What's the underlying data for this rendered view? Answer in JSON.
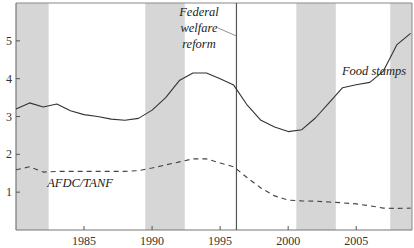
{
  "chart_data": {
    "type": "line",
    "title": "",
    "xlabel": "",
    "ylabel": "",
    "xlim": [
      1980,
      2009.1
    ],
    "ylim": [
      0,
      6
    ],
    "x_ticks": [
      1985,
      1990,
      1995,
      2000,
      2005
    ],
    "x_tick_labels": [
      "1985",
      "1990",
      "1995",
      "2000",
      "2005"
    ],
    "y_ticks": [
      1,
      2,
      3,
      4,
      5
    ],
    "y_tick_labels": [
      "1",
      "2",
      "3",
      "4",
      "5"
    ],
    "grid": false,
    "legend": "none (inline labels)",
    "shaded_periods": [
      {
        "start": 1980,
        "end": 1982.4
      },
      {
        "start": 1989.5,
        "end": 1992.4
      },
      {
        "start": 2000.6,
        "end": 2003.5
      },
      {
        "start": 2007.5,
        "end": 2009.1
      }
    ],
    "shade_color": "#d6d6d6",
    "vertical_marker": {
      "x": 1996.2,
      "label_lines": [
        "Federal",
        "welfare",
        "reform"
      ]
    },
    "x": [
      1980,
      1981,
      1982,
      1983,
      1984,
      1985,
      1986,
      1987,
      1988,
      1989,
      1990,
      1991,
      1992,
      1993,
      1994,
      1995,
      1996,
      1997,
      1998,
      1999,
      2000,
      2001,
      2002,
      2003,
      2004,
      2005,
      2006,
      2007,
      2008,
      2009
    ],
    "series": [
      {
        "name": "Food stamps",
        "style": "solid",
        "color": "#333333",
        "values": [
          3.2,
          3.36,
          3.25,
          3.33,
          3.15,
          3.05,
          3.0,
          2.93,
          2.9,
          2.95,
          3.17,
          3.5,
          3.95,
          4.15,
          4.15,
          4.0,
          3.83,
          3.3,
          2.9,
          2.72,
          2.6,
          2.65,
          2.96,
          3.36,
          3.76,
          3.84,
          3.9,
          4.2,
          4.9,
          5.2
        ]
      },
      {
        "name": "AFDC/TANF",
        "style": "dashed",
        "color": "#444444",
        "values": [
          1.59,
          1.67,
          1.53,
          1.55,
          1.55,
          1.55,
          1.55,
          1.55,
          1.55,
          1.57,
          1.64,
          1.72,
          1.8,
          1.88,
          1.88,
          1.77,
          1.67,
          1.38,
          1.11,
          0.9,
          0.79,
          0.77,
          0.76,
          0.74,
          0.72,
          0.69,
          0.64,
          0.58,
          0.57,
          0.58
        ]
      }
    ],
    "annotations": [
      {
        "text": "Food stamps",
        "x": 2003.5,
        "y": 4.4
      },
      {
        "text": "AFDC/TANF",
        "x": 1983.5,
        "y": 1.25
      },
      {
        "text": "Federal welfare reform",
        "x": 1992.5,
        "y": 5.5
      }
    ]
  }
}
